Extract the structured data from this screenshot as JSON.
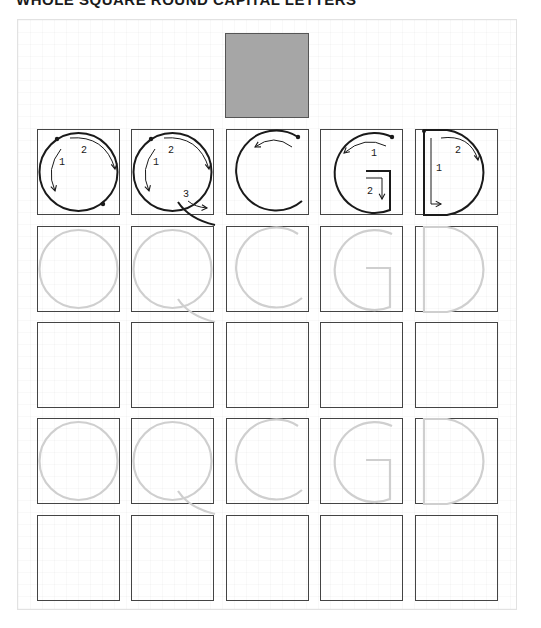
{
  "title": "WHOLE SQUARE ROUND CAPITAL LETTERS",
  "colors": {
    "swatch": "#a6a6a6",
    "ink": "#1a1a1a",
    "trace": "#cfcfcf",
    "box_border": "#444444"
  },
  "letters": [
    "O",
    "Q",
    "C",
    "G",
    "D"
  ],
  "rows": [
    {
      "kind": "model",
      "label": "stroke-order models"
    },
    {
      "kind": "trace",
      "label": "trace row 1"
    },
    {
      "kind": "blank",
      "label": "write row 1"
    },
    {
      "kind": "trace",
      "label": "trace row 2"
    },
    {
      "kind": "blank",
      "label": "write row 2"
    }
  ],
  "stroke_labels": {
    "O": [
      "1",
      "2"
    ],
    "Q": [
      "1",
      "2",
      "3"
    ],
    "C": [],
    "G": [
      "1",
      "2"
    ],
    "D": [
      "1",
      "2"
    ]
  }
}
